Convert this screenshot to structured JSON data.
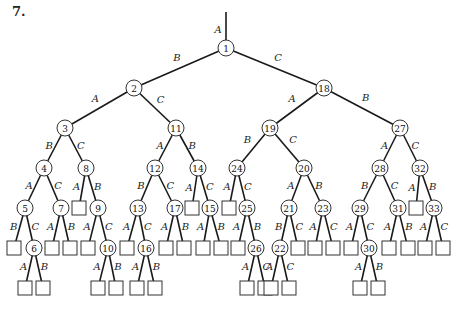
{
  "figure": {
    "label": "7."
  },
  "style": {
    "line_color": "#1a1a1a",
    "node_stroke": "#333333",
    "background": "#ffffff"
  },
  "root_edge": {
    "x": 226,
    "y1": 12,
    "y2": 48,
    "label": "A",
    "lx": 218,
    "ly": 29
  },
  "nodes": [
    {
      "id": "1",
      "type": "circle",
      "x": 226,
      "y": 48
    },
    {
      "id": "2",
      "type": "circle",
      "x": 134,
      "y": 88
    },
    {
      "id": "18",
      "type": "circle",
      "x": 324,
      "y": 88
    },
    {
      "id": "3",
      "type": "circle",
      "x": 65,
      "y": 128
    },
    {
      "id": "11",
      "type": "circle",
      "x": 176,
      "y": 128
    },
    {
      "id": "19",
      "type": "circle",
      "x": 270,
      "y": 128
    },
    {
      "id": "27",
      "type": "circle",
      "x": 400,
      "y": 128
    },
    {
      "id": "4",
      "type": "circle",
      "x": 44,
      "y": 168
    },
    {
      "id": "8",
      "type": "circle",
      "x": 86,
      "y": 168
    },
    {
      "id": "12",
      "type": "circle",
      "x": 155,
      "y": 168
    },
    {
      "id": "14",
      "type": "circle",
      "x": 198,
      "y": 168
    },
    {
      "id": "24",
      "type": "circle",
      "x": 237,
      "y": 168
    },
    {
      "id": "20",
      "type": "circle",
      "x": 304,
      "y": 168
    },
    {
      "id": "28",
      "type": "circle",
      "x": 380,
      "y": 168
    },
    {
      "id": "32",
      "type": "circle",
      "x": 420,
      "y": 168
    },
    {
      "id": "5",
      "type": "circle",
      "x": 25,
      "y": 208
    },
    {
      "id": "7",
      "type": "circle",
      "x": 61,
      "y": 208
    },
    {
      "id": "L8A",
      "type": "leaf",
      "x": 79,
      "y": 208
    },
    {
      "id": "9",
      "type": "circle",
      "x": 98,
      "y": 208
    },
    {
      "id": "13",
      "type": "circle",
      "x": 138,
      "y": 208
    },
    {
      "id": "17",
      "type": "circle",
      "x": 175,
      "y": 208
    },
    {
      "id": "L14A",
      "type": "leaf",
      "x": 192,
      "y": 208
    },
    {
      "id": "15",
      "type": "circle",
      "x": 210,
      "y": 208
    },
    {
      "id": "L24A",
      "type": "leaf",
      "x": 229,
      "y": 208
    },
    {
      "id": "25",
      "type": "circle",
      "x": 247,
      "y": 208
    },
    {
      "id": "21",
      "type": "circle",
      "x": 289,
      "y": 208
    },
    {
      "id": "23",
      "type": "circle",
      "x": 323,
      "y": 208
    },
    {
      "id": "29",
      "type": "circle",
      "x": 360,
      "y": 208
    },
    {
      "id": "31",
      "type": "circle",
      "x": 398,
      "y": 208
    },
    {
      "id": "L32A",
      "type": "leaf",
      "x": 416,
      "y": 208
    },
    {
      "id": "33",
      "type": "circle",
      "x": 434,
      "y": 208
    },
    {
      "id": "L5B",
      "type": "leaf",
      "x": 14,
      "y": 248
    },
    {
      "id": "6",
      "type": "circle",
      "x": 34,
      "y": 248
    },
    {
      "id": "L7A",
      "type": "leaf",
      "x": 52,
      "y": 248
    },
    {
      "id": "L7B",
      "type": "leaf",
      "x": 70,
      "y": 248
    },
    {
      "id": "L9A",
      "type": "leaf",
      "x": 88,
      "y": 248
    },
    {
      "id": "10",
      "type": "circle",
      "x": 108,
      "y": 248
    },
    {
      "id": "L13A",
      "type": "leaf",
      "x": 127,
      "y": 248
    },
    {
      "id": "16",
      "type": "circle",
      "x": 146,
      "y": 248
    },
    {
      "id": "L17A",
      "type": "leaf",
      "x": 166,
      "y": 248
    },
    {
      "id": "L17B",
      "type": "leaf",
      "x": 184,
      "y": 248
    },
    {
      "id": "L15A",
      "type": "leaf",
      "x": 203,
      "y": 248
    },
    {
      "id": "L15B",
      "type": "leaf",
      "x": 221,
      "y": 248
    },
    {
      "id": "L25A",
      "type": "leaf",
      "x": 238,
      "y": 248
    },
    {
      "id": "26",
      "type": "circle",
      "x": 256,
      "y": 248
    },
    {
      "id": "22",
      "type": "circle",
      "x": 280,
      "y": 248
    },
    {
      "id": "L21C",
      "type": "leaf",
      "x": 298,
      "y": 248
    },
    {
      "id": "L23A",
      "type": "leaf",
      "x": 315,
      "y": 248
    },
    {
      "id": "L23C",
      "type": "leaf",
      "x": 333,
      "y": 248
    },
    {
      "id": "L29A",
      "type": "leaf",
      "x": 351,
      "y": 248
    },
    {
      "id": "30",
      "type": "circle",
      "x": 369,
      "y": 248
    },
    {
      "id": "L31A",
      "type": "leaf",
      "x": 389,
      "y": 248
    },
    {
      "id": "L31B",
      "type": "leaf",
      "x": 408,
      "y": 248
    },
    {
      "id": "L33A",
      "type": "leaf",
      "x": 425,
      "y": 248
    },
    {
      "id": "L33C",
      "type": "leaf",
      "x": 443,
      "y": 248
    },
    {
      "id": "L6A",
      "type": "leaf",
      "x": 25,
      "y": 288
    },
    {
      "id": "L6B",
      "type": "leaf",
      "x": 43,
      "y": 288
    },
    {
      "id": "L10A",
      "type": "leaf",
      "x": 98,
      "y": 288
    },
    {
      "id": "L10B",
      "type": "leaf",
      "x": 116,
      "y": 288
    },
    {
      "id": "L16A",
      "type": "leaf",
      "x": 137,
      "y": 288
    },
    {
      "id": "L16B",
      "type": "leaf",
      "x": 155,
      "y": 288
    },
    {
      "id": "L26A",
      "type": "leaf",
      "x": 247,
      "y": 288
    },
    {
      "id": "L26C",
      "type": "leaf",
      "x": 265,
      "y": 288
    },
    {
      "id": "L22A",
      "type": "leaf",
      "x": 271,
      "y": 288
    },
    {
      "id": "L22C",
      "type": "leaf",
      "x": 289,
      "y": 288
    },
    {
      "id": "L30A",
      "type": "leaf",
      "x": 360,
      "y": 288
    },
    {
      "id": "L30B",
      "type": "leaf",
      "x": 378,
      "y": 288
    }
  ],
  "edges": [
    {
      "from": "1",
      "to": "2",
      "label": "B"
    },
    {
      "from": "1",
      "to": "18",
      "label": "C"
    },
    {
      "from": "2",
      "to": "3",
      "label": "A"
    },
    {
      "from": "2",
      "to": "11",
      "label": "C"
    },
    {
      "from": "18",
      "to": "19",
      "label": "A"
    },
    {
      "from": "18",
      "to": "27",
      "label": "B"
    },
    {
      "from": "3",
      "to": "4",
      "label": "B"
    },
    {
      "from": "3",
      "to": "8",
      "label": "C"
    },
    {
      "from": "11",
      "to": "12",
      "label": "A"
    },
    {
      "from": "11",
      "to": "14",
      "label": "B"
    },
    {
      "from": "19",
      "to": "24",
      "label": "B"
    },
    {
      "from": "19",
      "to": "20",
      "label": "C"
    },
    {
      "from": "27",
      "to": "28",
      "label": "A"
    },
    {
      "from": "27",
      "to": "32",
      "label": "C"
    },
    {
      "from": "4",
      "to": "5",
      "label": "A"
    },
    {
      "from": "4",
      "to": "7",
      "label": "C"
    },
    {
      "from": "8",
      "to": "L8A",
      "label": "A"
    },
    {
      "from": "8",
      "to": "9",
      "label": "B"
    },
    {
      "from": "12",
      "to": "13",
      "label": "B"
    },
    {
      "from": "12",
      "to": "17",
      "label": "C"
    },
    {
      "from": "14",
      "to": "L14A",
      "label": "A"
    },
    {
      "from": "14",
      "to": "15",
      "label": "C"
    },
    {
      "from": "24",
      "to": "L24A",
      "label": "A"
    },
    {
      "from": "24",
      "to": "25",
      "label": "C"
    },
    {
      "from": "20",
      "to": "21",
      "label": "A"
    },
    {
      "from": "20",
      "to": "23",
      "label": "B"
    },
    {
      "from": "28",
      "to": "29",
      "label": "B"
    },
    {
      "from": "28",
      "to": "31",
      "label": "C"
    },
    {
      "from": "32",
      "to": "L32A",
      "label": "A"
    },
    {
      "from": "32",
      "to": "33",
      "label": "B"
    },
    {
      "from": "5",
      "to": "L5B",
      "label": "B"
    },
    {
      "from": "5",
      "to": "6",
      "label": "C"
    },
    {
      "from": "7",
      "to": "L7A",
      "label": "A"
    },
    {
      "from": "7",
      "to": "L7B",
      "label": "B"
    },
    {
      "from": "9",
      "to": "L9A",
      "label": "A"
    },
    {
      "from": "9",
      "to": "10",
      "label": "C"
    },
    {
      "from": "13",
      "to": "L13A",
      "label": "A"
    },
    {
      "from": "13",
      "to": "16",
      "label": "C"
    },
    {
      "from": "17",
      "to": "L17A",
      "label": "A"
    },
    {
      "from": "17",
      "to": "L17B",
      "label": "B"
    },
    {
      "from": "15",
      "to": "L15A",
      "label": "A"
    },
    {
      "from": "15",
      "to": "L15B",
      "label": "B"
    },
    {
      "from": "25",
      "to": "L25A",
      "label": "A"
    },
    {
      "from": "25",
      "to": "26",
      "label": "B"
    },
    {
      "from": "21",
      "to": "22",
      "label": "B"
    },
    {
      "from": "21",
      "to": "L21C",
      "label": "C"
    },
    {
      "from": "23",
      "to": "L23A",
      "label": "A"
    },
    {
      "from": "23",
      "to": "L23C",
      "label": "C"
    },
    {
      "from": "29",
      "to": "L29A",
      "label": "A"
    },
    {
      "from": "29",
      "to": "30",
      "label": "C"
    },
    {
      "from": "31",
      "to": "L31A",
      "label": "A"
    },
    {
      "from": "31",
      "to": "L31B",
      "label": "B"
    },
    {
      "from": "33",
      "to": "L33A",
      "label": "A"
    },
    {
      "from": "33",
      "to": "L33C",
      "label": "C"
    },
    {
      "from": "6",
      "to": "L6A",
      "label": "A"
    },
    {
      "from": "6",
      "to": "L6B",
      "label": "B"
    },
    {
      "from": "10",
      "to": "L10A",
      "label": "A"
    },
    {
      "from": "10",
      "to": "L10B",
      "label": "B"
    },
    {
      "from": "16",
      "to": "L16A",
      "label": "A"
    },
    {
      "from": "16",
      "to": "L16B",
      "label": "B"
    },
    {
      "from": "26",
      "to": "L26A",
      "label": "A"
    },
    {
      "from": "26",
      "to": "L26C",
      "label": "C"
    },
    {
      "from": "22",
      "to": "L22A",
      "label": "A"
    },
    {
      "from": "22",
      "to": "L22C",
      "label": "C"
    },
    {
      "from": "30",
      "to": "L30A",
      "label": "A"
    },
    {
      "from": "30",
      "to": "L30B",
      "label": "B"
    }
  ]
}
